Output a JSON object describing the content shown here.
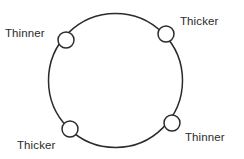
{
  "diagram": {
    "type": "ring-with-nodes",
    "background_color": "#ffffff",
    "stroke_color": "#2b2b2b",
    "node_fill_color": "#ffffff",
    "main_circle": {
      "center_x": 115.5,
      "center_y": 80.5,
      "radius": 67,
      "stroke_width": 1.5
    },
    "nodes": [
      {
        "id": "node-top-left",
        "cx": 66,
        "cy": 40,
        "r": 8,
        "label": "Thinner"
      },
      {
        "id": "node-top-right",
        "cx": 166,
        "cy": 34,
        "r": 8,
        "label": "Thicker"
      },
      {
        "id": "node-bottom-left",
        "cx": 70,
        "cy": 129,
        "r": 8,
        "label": "Thicker"
      },
      {
        "id": "node-bottom-right",
        "cx": 172,
        "cy": 123,
        "r": 8,
        "label": "Thinner"
      }
    ],
    "labels": {
      "top_left": "Thinner",
      "top_right": "Thicker",
      "bottom_left": "Thicker",
      "bottom_right": "Thinner"
    }
  }
}
